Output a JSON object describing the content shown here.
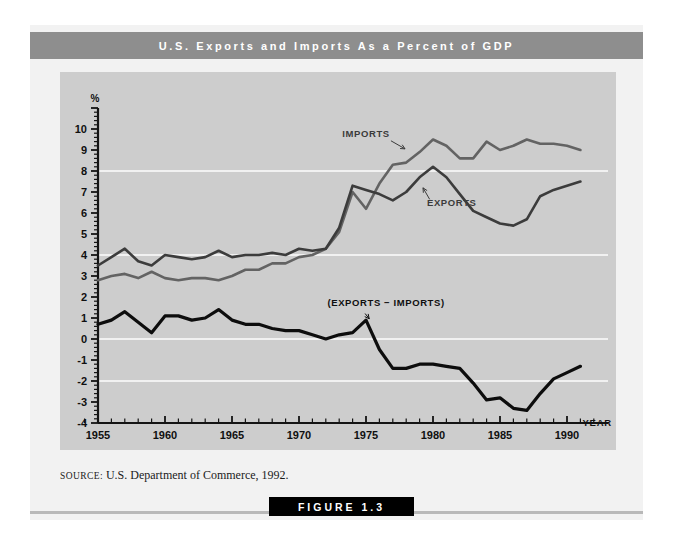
{
  "figure": {
    "title": "U.S. Exports and Imports As a Percent of GDP",
    "source": "U.S. Department of Commerce, 1992.",
    "source_label": "SOURCE:",
    "caption": "FIGURE 1.3",
    "title_bar_color": "#8e8e8e",
    "plot_bg_color": "#cdcdcd",
    "page_bg_color": "#f2f2f2"
  },
  "chart_data": {
    "type": "line",
    "title": "U.S. Exports and Imports As a Percent of GDP",
    "xlabel": "Year",
    "ylabel": "%",
    "xlim": [
      1954,
      1992
    ],
    "ylim": [
      -4,
      11
    ],
    "ytick_step": 1,
    "yticks": [
      -4,
      -3,
      -2,
      -1,
      0,
      1,
      2,
      3,
      4,
      5,
      6,
      7,
      8,
      9,
      10
    ],
    "ytick_labels": [
      "-4",
      "-3",
      "-2",
      "-1",
      "0",
      "1",
      "2",
      "3",
      "4",
      "5",
      "6",
      "7",
      "8",
      "9",
      "10"
    ],
    "xticks": [
      1955,
      1960,
      1965,
      1970,
      1975,
      1980,
      1985,
      1990
    ],
    "xtick_labels": [
      "1955",
      "1960",
      "1965",
      "1970",
      "1975",
      "1980",
      "1985",
      "1990"
    ],
    "gridlines_y": [
      8,
      4,
      0,
      -2
    ],
    "grid": true,
    "grid_color": "#ffffff",
    "legend": "inline-annotations",
    "annotations": [
      {
        "text": "IMPORTS",
        "x": 1975.0,
        "y": 9.6,
        "points_to": {
          "x": 1978.2,
          "y": 9.0
        }
      },
      {
        "text": "EXPORTS",
        "x": 1981.4,
        "y": 6.35,
        "points_to": {
          "x": 1979.0,
          "y": 7.3
        }
      },
      {
        "text": "(EXPORTS − IMPORTS)",
        "x": 1976.5,
        "y": 1.55,
        "points_to": {
          "x": 1975.0,
          "y": 0.85
        }
      }
    ],
    "x": [
      1955,
      1956,
      1957,
      1958,
      1959,
      1960,
      1961,
      1962,
      1963,
      1964,
      1965,
      1966,
      1967,
      1968,
      1969,
      1970,
      1971,
      1972,
      1973,
      1974,
      1975,
      1976,
      1977,
      1978,
      1979,
      1980,
      1981,
      1982,
      1983,
      1984,
      1985,
      1986,
      1987,
      1988,
      1989,
      1990,
      1991
    ],
    "series": [
      {
        "name": "Imports",
        "color": "#636363",
        "width": 2.6,
        "values": [
          2.8,
          3.0,
          3.1,
          2.9,
          3.2,
          2.9,
          2.8,
          2.9,
          2.9,
          2.8,
          3.0,
          3.3,
          3.3,
          3.6,
          3.6,
          3.9,
          4.0,
          4.3,
          5.1,
          7.0,
          6.2,
          7.4,
          8.3,
          8.4,
          8.9,
          9.5,
          9.2,
          8.6,
          8.6,
          9.4,
          9.0,
          9.2,
          9.5,
          9.3,
          9.3,
          9.2,
          9.0
        ]
      },
      {
        "name": "Exports",
        "color": "#3c3c3c",
        "width": 2.6,
        "values": [
          3.5,
          3.9,
          4.3,
          3.7,
          3.5,
          4.0,
          3.9,
          3.8,
          3.9,
          4.2,
          3.9,
          4.0,
          4.0,
          4.1,
          4.0,
          4.3,
          4.2,
          4.3,
          5.3,
          7.3,
          7.1,
          6.9,
          6.6,
          7.0,
          7.7,
          8.2,
          7.7,
          6.9,
          6.1,
          5.8,
          5.5,
          5.4,
          5.7,
          6.8,
          7.1,
          7.3,
          7.5
        ]
      },
      {
        "name": "(Exports − Imports)",
        "color": "#0d0d0d",
        "width": 3.2,
        "values": [
          0.7,
          0.9,
          1.3,
          0.8,
          0.3,
          1.1,
          1.1,
          0.9,
          1.0,
          1.4,
          0.9,
          0.7,
          0.7,
          0.5,
          0.4,
          0.4,
          0.2,
          0.0,
          0.2,
          0.3,
          0.9,
          -0.5,
          -1.4,
          -1.4,
          -1.2,
          -1.2,
          -1.3,
          -1.4,
          -2.1,
          -2.9,
          -2.8,
          -3.3,
          -3.4,
          -2.6,
          -1.9,
          -1.6,
          -1.3
        ]
      }
    ]
  },
  "axis": {
    "percent_symbol": "%",
    "year_label": "YEAR"
  }
}
